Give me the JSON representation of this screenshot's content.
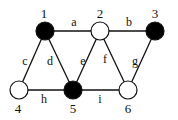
{
  "graph": {
    "nodes": [
      {
        "id": "1",
        "label": "1",
        "x": 45,
        "y": 31,
        "fill": "#000000",
        "lx": 44,
        "ly": 18
      },
      {
        "id": "2",
        "label": "2",
        "x": 100,
        "y": 31,
        "fill": "#ffffff",
        "lx": 100,
        "ly": 18
      },
      {
        "id": "3",
        "label": "3",
        "x": 155,
        "y": 31,
        "fill": "#000000",
        "lx": 155,
        "ly": 18
      },
      {
        "id": "4",
        "label": "4",
        "x": 19,
        "y": 90,
        "fill": "#ffffff",
        "lx": 18,
        "ly": 113
      },
      {
        "id": "5",
        "label": "5",
        "x": 73,
        "y": 90,
        "fill": "#000000",
        "lx": 73,
        "ly": 113
      },
      {
        "id": "6",
        "label": "6",
        "x": 128,
        "y": 90,
        "fill": "#ffffff",
        "lx": 128,
        "ly": 113
      }
    ],
    "edges": [
      {
        "label": "a",
        "from": "1",
        "to": "2",
        "lx": 74,
        "ly": 26
      },
      {
        "label": "b",
        "from": "2",
        "to": "3",
        "lx": 129,
        "ly": 26
      },
      {
        "label": "c",
        "from": "1",
        "to": "4",
        "lx": 25,
        "ly": 65
      },
      {
        "label": "d",
        "from": "1",
        "to": "5",
        "lx": 50,
        "ly": 65
      },
      {
        "label": "e",
        "from": "2",
        "to": "5",
        "lx": 83,
        "ly": 65
      },
      {
        "label": "f",
        "from": "2",
        "to": "6",
        "lx": 105,
        "ly": 63
      },
      {
        "label": "g",
        "from": "3",
        "to": "6",
        "lx": 135,
        "ly": 65
      },
      {
        "label": "h",
        "from": "4",
        "to": "5",
        "lx": 44,
        "ly": 103
      },
      {
        "label": "i",
        "from": "5",
        "to": "6",
        "lx": 100,
        "ly": 103
      }
    ],
    "node_radius": 9,
    "stroke_color": "#111111"
  }
}
